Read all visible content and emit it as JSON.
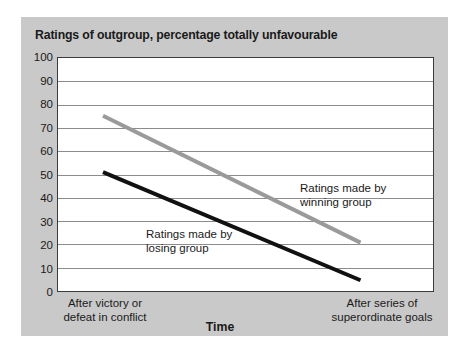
{
  "chart_data": {
    "type": "line",
    "title": "Ratings of outgroup, percentage totally unfavourable",
    "xlabel": "Time",
    "ylabel": "",
    "ylim": [
      0,
      100
    ],
    "yticks": [
      100,
      90,
      80,
      70,
      60,
      50,
      40,
      30,
      20,
      10,
      0
    ],
    "grid": true,
    "legend": "in-plot annotations",
    "categories": [
      "After victory or defeat in conflict",
      "After series of superordinate goals"
    ],
    "x_tick_labels": [
      {
        "line1": "After victory or",
        "line2": "defeat in conflict"
      },
      {
        "line1": "After series of",
        "line2": "superordinate goals"
      }
    ],
    "series": [
      {
        "name": "Ratings made by winning group",
        "color": "#9a9a9a",
        "values": [
          75,
          21
        ],
        "annotation": {
          "line1": "Ratings made by",
          "line2": "winning group"
        }
      },
      {
        "name": "Ratings made by losing group",
        "color": "#111111",
        "values": [
          51,
          5
        ],
        "annotation": {
          "line1": "Ratings made by",
          "line2": "losing group"
        }
      }
    ],
    "colors": {
      "panel_background": "#c9c9c9",
      "plot_background": "#ffffff",
      "gridline": "#8c8c8c",
      "axis": "#3b3b3b",
      "text": "#1a1a1a"
    }
  }
}
